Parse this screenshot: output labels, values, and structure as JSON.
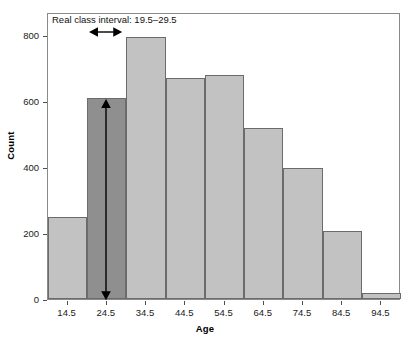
{
  "chart_data": {
    "type": "bar",
    "title": "",
    "subtitle": "",
    "xlabel": "Age",
    "ylabel": "Count",
    "categories": [
      "14.5",
      "24.5",
      "34.5",
      "44.5",
      "54.5",
      "64.5",
      "74.5",
      "84.5",
      "94.5"
    ],
    "values": [
      248,
      610,
      795,
      670,
      678,
      518,
      397,
      205,
      18
    ],
    "ylim": [
      0,
      870
    ],
    "yticks": [
      0,
      200,
      400,
      600,
      800
    ],
    "ytick_labels": [
      "0",
      "200",
      "400",
      "600",
      "800"
    ],
    "xtick_labels": [
      "14.5",
      "24.5",
      "34.5",
      "44.5",
      "54.5",
      "64.5",
      "74.5",
      "84.5",
      "94.5"
    ],
    "grid": false,
    "legend": null,
    "bar_colors": {
      "default": "#c2c2c2",
      "highlight": "#8f8f8f",
      "edge": "#6b6b6b"
    },
    "highlight_index": 1,
    "annotations": [
      {
        "name": "real-class-interval",
        "text": "Real class interval: 19.5–29.5",
        "kind": "text"
      },
      {
        "name": "interval-width-arrow",
        "text": "",
        "kind": "horizontal-double-arrow",
        "spans": "19.5 to 29.5"
      },
      {
        "name": "bar-height-arrow",
        "text": "",
        "kind": "vertical-double-arrow",
        "spans": "0 to 610"
      }
    ]
  },
  "axes": {
    "ylabel": "Count",
    "xlabel": "Age"
  },
  "icons": {
    "arrow_left": "arrow-left-icon",
    "arrow_right": "arrow-right-icon",
    "arrow_up": "arrow-up-icon",
    "arrow_down": "arrow-down-icon"
  }
}
